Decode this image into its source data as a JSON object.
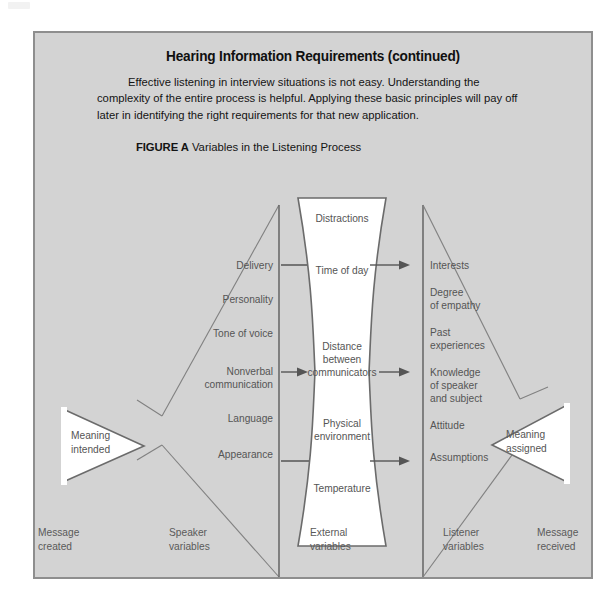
{
  "page": {
    "heading": "Hearing Information Requirements (continued)",
    "body_paragraph": "Effective listening in interview situations is not easy. Understanding the complexity of the entire process is helpful. Applying these basic principles will pay off later in identifying the right requirements for that new application.",
    "figure_label": "FIGURE A",
    "figure_title": "Variables in the Listening Process",
    "panel_background": "#d3d3d3",
    "panel_border": "#8e8e8e",
    "label_color": "#555555"
  },
  "diagram": {
    "left_funnel": {
      "endpoint_label_line1": "Meaning",
      "endpoint_label_line2": "intended",
      "column_title_line1": "Speaker",
      "column_title_line2": "variables",
      "items": [
        "Delivery",
        "Personality",
        "Tone of voice",
        "Nonverbal",
        "communication",
        "Language",
        "Appearance"
      ]
    },
    "center_column": {
      "column_title_line1": "External",
      "column_title_line2": "variables",
      "items": [
        "Distractions",
        "Time of day",
        "Distance",
        "between",
        "communicators",
        "Physical",
        "environment",
        "Temperature"
      ]
    },
    "right_funnel": {
      "endpoint_label_line1": "Meaning",
      "endpoint_label_line2": "assigned",
      "column_title_line1": "Listener",
      "column_title_line2": "variables",
      "items": [
        "Interests",
        "Degree",
        "of empathy",
        "Past",
        "experiences",
        "Knowledge",
        "of speaker",
        "and subject",
        "Attitude",
        "Assumptions"
      ]
    },
    "footer_labels": {
      "far_left_line1": "Message",
      "far_left_line2": "created",
      "far_right_line1": "Message",
      "far_right_line2": "received"
    }
  }
}
